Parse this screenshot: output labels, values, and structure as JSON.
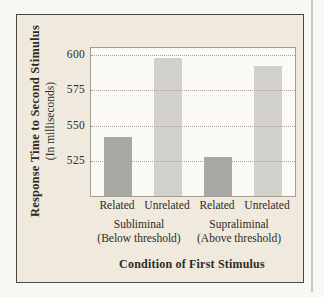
{
  "figure": {
    "y_axis_title": "Response Time to Second Stimulus",
    "y_axis_subtitle": "(In milliseconds)",
    "x_axis_title": "Condition of First Stimulus"
  },
  "chart_data": {
    "type": "bar",
    "categories": [
      "Related",
      "Unrelated",
      "Related",
      "Unrelated"
    ],
    "values": [
      542,
      598,
      528,
      592
    ],
    "groups": [
      {
        "label": "Subliminal",
        "sublabel": "(Below threshold)"
      },
      {
        "label": "Supraliminal",
        "sublabel": "(Above threshold)"
      }
    ],
    "yticks": [
      525,
      550,
      575,
      600
    ],
    "ylim": [
      500,
      605
    ],
    "ylabel": "Response Time to Second Stimulus (In milliseconds)",
    "xlabel": "Condition of First Stimulus",
    "grid": "horizontal-dotted",
    "legend": "none",
    "bar_colors": {
      "related": "#a8a8a5",
      "unrelated": "#d1d0ca"
    }
  },
  "colors": {
    "figure_background": "#efeadd",
    "plot_background": "#fbfaf5",
    "frame_border": "#4a4842",
    "axis_border": "#a49e90",
    "gridline": "#a9a294",
    "text": "#2e2b26"
  }
}
